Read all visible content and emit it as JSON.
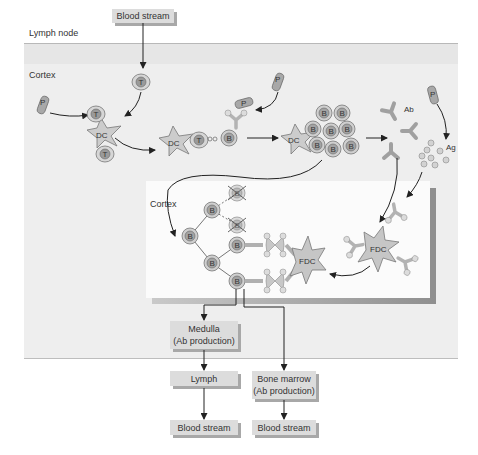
{
  "regions": {
    "lymph_node": "Lymph node",
    "cortex_outer": "Cortex",
    "cortex_inner": "Cortex"
  },
  "boxes": {
    "blood_stream_top": "Blood stream",
    "medulla_line1": "Medulla",
    "medulla_line2": "(Ab production)",
    "lymph": "Lymph",
    "bone_marrow_line1": "Bone marrow",
    "bone_marrow_line2": "(Ab production)",
    "blood_stream_left": "Blood stream",
    "blood_stream_right": "Blood stream"
  },
  "cells": {
    "T": "T",
    "B": "B",
    "DC": "DC",
    "FDC": "FDC",
    "P": "P",
    "Ab": "Ab",
    "Ag": "Ag"
  },
  "colors": {
    "cell_fill": "#c8c8c8",
    "nucleus_fill": "#9a9a9a",
    "background_cortex": "#eeeeee",
    "inner_box": "#fbfbfb",
    "box_fill": "#dcdcdc",
    "arrow": "#222222"
  }
}
